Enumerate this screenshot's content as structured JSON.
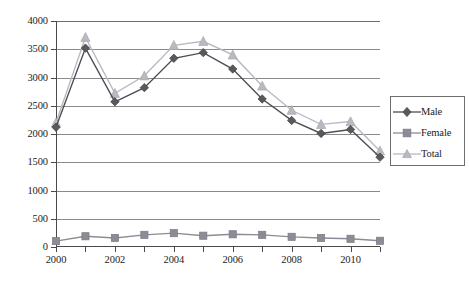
{
  "chart_data": {
    "type": "line",
    "title": "",
    "subtitle": "",
    "xlabel": "",
    "ylabel": "",
    "x": [
      2000,
      2001,
      2002,
      2003,
      2004,
      2005,
      2006,
      2007,
      2008,
      2009,
      2010,
      2011
    ],
    "xlim": [
      2000,
      2011
    ],
    "ylim": [
      0,
      4000
    ],
    "yticks": [
      0,
      500,
      1000,
      1500,
      2000,
      2500,
      3000,
      3500,
      4000
    ],
    "ytick_labels": [
      "0",
      "500",
      "1000",
      "1500",
      "2000",
      "2500",
      "3000",
      "3500",
      "4000"
    ],
    "xticks": [
      2000,
      2001,
      2002,
      2003,
      2004,
      2005,
      2006,
      2007,
      2008,
      2009,
      2010,
      2011
    ],
    "xtick_labels_shown": [
      "2000",
      "2002",
      "2004",
      "2006",
      "2008",
      "2010"
    ],
    "grid": "horizontal",
    "legend_position": "right",
    "series": [
      {
        "name": "Male",
        "marker": "diamond",
        "color": "#595959",
        "line_color": "#4d4d56",
        "values": [
          2120,
          3520,
          2570,
          2820,
          3340,
          3440,
          3150,
          2620,
          2240,
          2010,
          2080,
          1590
        ]
      },
      {
        "name": "Female",
        "marker": "square",
        "color": "#8c8c96",
        "line_color": "#8c8c96",
        "values": [
          105,
          190,
          160,
          215,
          245,
          200,
          225,
          215,
          180,
          160,
          145,
          110
        ]
      },
      {
        "name": "Total",
        "marker": "triangle",
        "color": "#b9b9c2",
        "line_color": "#b9b9c2",
        "values": [
          2200,
          3710,
          2720,
          3030,
          3570,
          3640,
          3400,
          2850,
          2420,
          2170,
          2220,
          1700
        ]
      }
    ]
  },
  "legend": {
    "entries": [
      {
        "label": "Male"
      },
      {
        "label": "Female"
      },
      {
        "label": "Total"
      }
    ]
  }
}
